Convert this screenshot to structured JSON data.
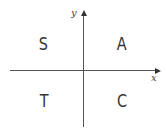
{
  "diagram": {
    "axes": {
      "x_label": "x",
      "y_label": "y"
    },
    "quadrants": {
      "top_left": "S",
      "top_right": "A",
      "bottom_left": "T",
      "bottom_right": "C"
    }
  }
}
